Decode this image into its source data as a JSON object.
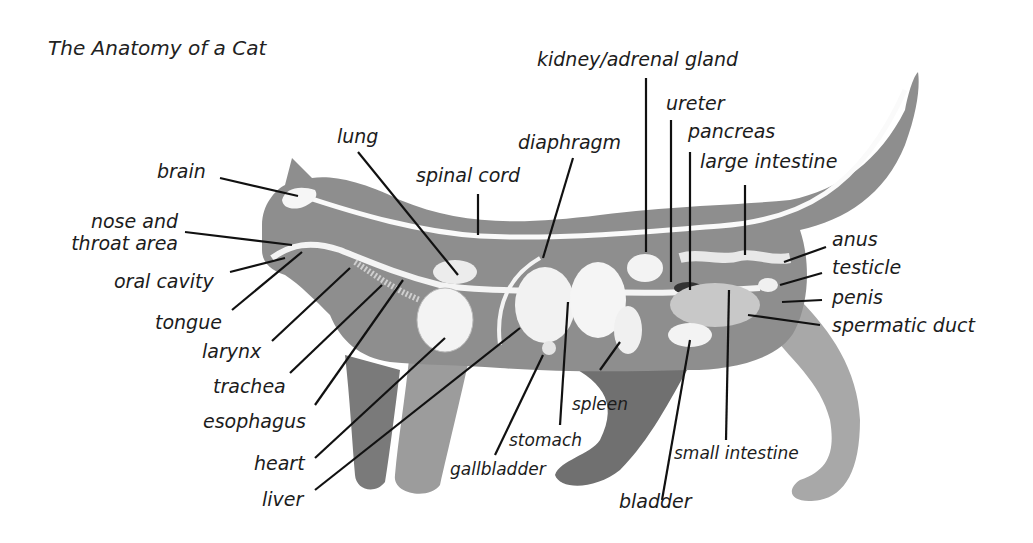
{
  "title": "The Anatomy of a Cat",
  "labels": {
    "brain": "brain",
    "nose_throat_1": "nose and",
    "nose_throat_2": "throat area",
    "oral_cavity": "oral cavity",
    "tongue": "tongue",
    "larynx": "larynx",
    "trachea": "trachea",
    "esophagus": "esophagus",
    "heart": "heart",
    "liver": "liver",
    "lung": "lung",
    "spinal_cord": "spinal cord",
    "diaphragm": "diaphragm",
    "kidney": "kidney/adrenal gland",
    "ureter": "ureter",
    "pancreas": "pancreas",
    "large_intestine": "large intestine",
    "anus": "anus",
    "testicle": "testicle",
    "penis": "penis",
    "spermatic_duct": "spermatic duct",
    "spleen": "spleen",
    "stomach": "stomach",
    "gallbladder": "gallbladder",
    "small_intestine": "small intestine",
    "bladder": "bladder"
  },
  "colors": {
    "body": "#8f8f8f",
    "body_dark": "#6e6e6e",
    "legs": "#a3a3a3",
    "organ": "#f4f4f4",
    "leader": "#111111"
  }
}
